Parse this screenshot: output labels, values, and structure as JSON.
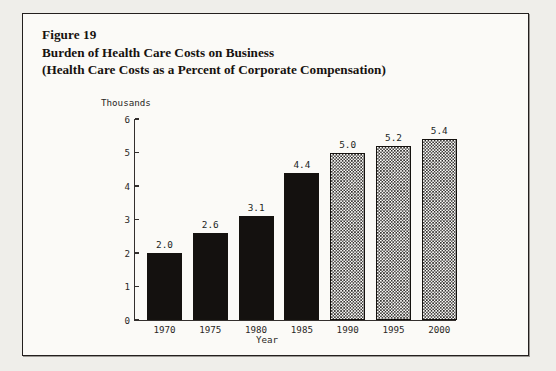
{
  "figure": {
    "number_label": "Figure 19",
    "title_line_1": "Burden of Health Care Costs on Business",
    "title_line_2": "(Health Care Costs as a Percent of Corporate Compensation)"
  },
  "chart_data": {
    "type": "bar",
    "title": "Burden of Health Care Costs on Business",
    "subtitle": "(Health Care Costs as a Percent of Corporate Compensation)",
    "categories": [
      "1970",
      "1975",
      "1980",
      "1985",
      "1990",
      "1995",
      "2000"
    ],
    "values": [
      2.0,
      2.6,
      3.1,
      4.4,
      5.0,
      5.2,
      5.4
    ],
    "value_labels": [
      "2.0",
      "2.6",
      "3.1",
      "4.4",
      "5.0",
      "5.2",
      "5.4"
    ],
    "bar_styles": [
      "solid",
      "solid",
      "solid",
      "solid",
      "hatch",
      "hatch",
      "hatch"
    ],
    "xlabel": "Year",
    "ylabel": "Thousands",
    "ylim": [
      0,
      6
    ],
    "ytick_labels": [
      "0",
      "1",
      "2",
      "3",
      "4",
      "5",
      "6"
    ],
    "yticks": [
      0,
      1,
      2,
      3,
      4,
      5,
      6
    ],
    "grid": false,
    "legend": false,
    "colors": {
      "bar_solid": "#14110f",
      "bar_hatch_ink": "#2b2826",
      "axis": "#332f2d",
      "text": "#221f1d",
      "panel_background": "#fbfaf7",
      "frame": "#231f1e"
    }
  }
}
